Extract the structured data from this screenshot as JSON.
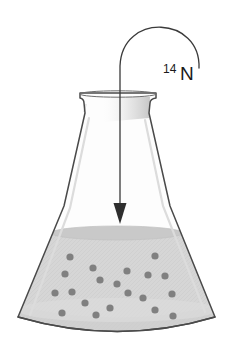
{
  "figure": {
    "type": "scientific-illustration",
    "background_color": "#ffffff"
  },
  "label": {
    "mass_number": "14",
    "element_symbol": "N",
    "full_text": "14N",
    "color": "#1a1a1a"
  },
  "arrow": {
    "name": "curved-entry-arrow",
    "color": "#3a3a3a",
    "path": "M 200 66 C 200 14, 120 14, 120 70 L 120 210",
    "head_points": "113,205 127,205 120,224",
    "description": "curved arrow looping from label down into flask"
  },
  "flask": {
    "name": "erlenmeyer-flask",
    "outline_color": "#4a4a4a",
    "highlight_color": "#d8d8d8",
    "glass_fill": "#fdfdfd",
    "rim_path": "M 80 93 L 156 93 L 156 97 L 151 101 L 149 112 L 170 206 L 215 317 L 18 317 L 64 206 L 85 112 L 83 101 L 80 97 Z",
    "body_path": "M 85 112 L 149 112 L 170 206 L 215 317 Q 118 346 18 317 L 64 206 Z",
    "rim_ellipse": {
      "cx": 118,
      "cy": 94,
      "rx": 38,
      "ry": 4
    },
    "base_curve": "M 18 317 Q 118 346 215 317"
  },
  "liquid": {
    "name": "liquid-fill",
    "fill_color": "#d6d6d6",
    "surface_color": "#c9c9c9",
    "surface_ellipse": {
      "cx": 117,
      "cy": 233,
      "rx": 62,
      "ry": 8
    },
    "top_y": 233,
    "shape_path": "M 55 233 L 180 233 L 215 317 Q 118 346 18 317 Z",
    "bottom_band_color": "#cfcfcf"
  },
  "particles": {
    "name": "nitrogen-particles",
    "color": "#808080",
    "radius": 3.6,
    "count": 20,
    "positions": [
      {
        "x": 70,
        "y": 257
      },
      {
        "x": 155,
        "y": 256
      },
      {
        "x": 65,
        "y": 274
      },
      {
        "x": 93,
        "y": 268
      },
      {
        "x": 127,
        "y": 271
      },
      {
        "x": 100,
        "y": 280
      },
      {
        "x": 128,
        "y": 293
      },
      {
        "x": 148,
        "y": 275
      },
      {
        "x": 165,
        "y": 276
      },
      {
        "x": 117,
        "y": 284
      },
      {
        "x": 72,
        "y": 292
      },
      {
        "x": 55,
        "y": 293
      },
      {
        "x": 172,
        "y": 294
      },
      {
        "x": 143,
        "y": 298
      },
      {
        "x": 85,
        "y": 303
      },
      {
        "x": 62,
        "y": 313
      },
      {
        "x": 110,
        "y": 308
      },
      {
        "x": 96,
        "y": 315
      },
      {
        "x": 155,
        "y": 310
      },
      {
        "x": 173,
        "y": 316
      }
    ]
  }
}
